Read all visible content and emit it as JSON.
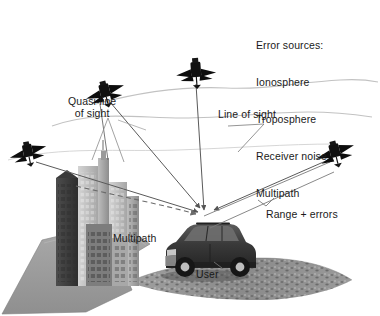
{
  "figure": {
    "kind": "gnss-error-sources-diagram",
    "background": "#ffffff",
    "width": 380,
    "height": 316
  },
  "labels": {
    "error_sources_heading": "Error sources:",
    "error_sources": [
      "Ionosphere",
      "Troposphere",
      "Receiver noise",
      "Multipath"
    ],
    "quasi_line_of_sight": "Quasi-line\nof sight",
    "line_of_sight": "Line of sight",
    "range_plus_errors": "Range + errors",
    "multipath": "Multipath",
    "user": "User"
  },
  "colors": {
    "text": "#1a1a1a",
    "signal_line": "#5a5a5a",
    "atmosphere_line": "#b9b9b9",
    "satellite_body": "#0d0d0d",
    "ground": "#9a9a9a",
    "road": "#8c8c8c",
    "building_light": "#c9c9c9",
    "building_mid": "#9e9e9e",
    "building_dark": "#4a4a4a",
    "vehicle_body": "#3a3a3a",
    "vehicle_glass": "#6e6e6e"
  },
  "satellites": [
    {
      "name": "satellite-left",
      "x": 28,
      "y": 152
    },
    {
      "name": "satellite-upper-left",
      "x": 105,
      "y": 92
    },
    {
      "name": "satellite-top",
      "x": 196,
      "y": 72
    },
    {
      "name": "satellite-right",
      "x": 335,
      "y": 152
    }
  ],
  "receiver": {
    "name": "user-vehicle",
    "x": 205,
    "y": 215
  },
  "atmosphere_layers": [
    {
      "name": "ionosphere-wave",
      "y": 88
    },
    {
      "name": "troposphere-wave",
      "y": 118
    }
  ],
  "signal_paths": [
    {
      "from": "satellite-left",
      "to": "receiver",
      "style": "solid"
    },
    {
      "from": "satellite-upper-left",
      "to": "receiver",
      "style": "solid"
    },
    {
      "from": "satellite-top",
      "to": "receiver",
      "style": "solid"
    },
    {
      "from": "satellite-right",
      "to": "receiver",
      "style": "solid"
    },
    {
      "from": "buildings",
      "to": "receiver",
      "style": "dashed"
    }
  ]
}
